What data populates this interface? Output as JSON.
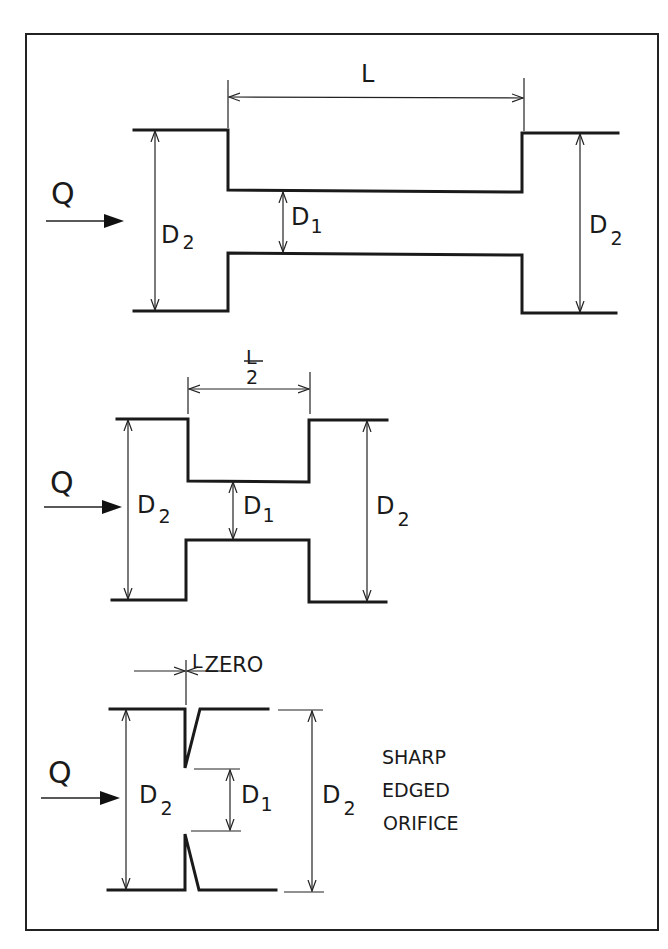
{
  "diagram": {
    "title": "",
    "panels": [
      {
        "id": "long-constriction",
        "flow_label": "Q",
        "length_label": "L",
        "inner_diameter": {
          "main": "D",
          "sub": "1"
        },
        "outer_diameter": {
          "main": "D",
          "sub": "2"
        }
      },
      {
        "id": "half-length-constriction",
        "flow_label": "Q",
        "length_label_num": "L",
        "length_label_den": "2",
        "inner_diameter": {
          "main": "D",
          "sub": "1"
        },
        "outer_diameter": {
          "main": "D",
          "sub": "2"
        }
      },
      {
        "id": "sharp-edged-orifice",
        "flow_label": "Q",
        "length_label": {
          "main": "L",
          "sub": "ZERO"
        },
        "inner_diameter": {
          "main": "D",
          "sub": "1"
        },
        "outer_diameter": {
          "main": "D",
          "sub": "2"
        },
        "note_lines": [
          "SHARP",
          "EDGED",
          "ORIFICE"
        ]
      }
    ]
  }
}
